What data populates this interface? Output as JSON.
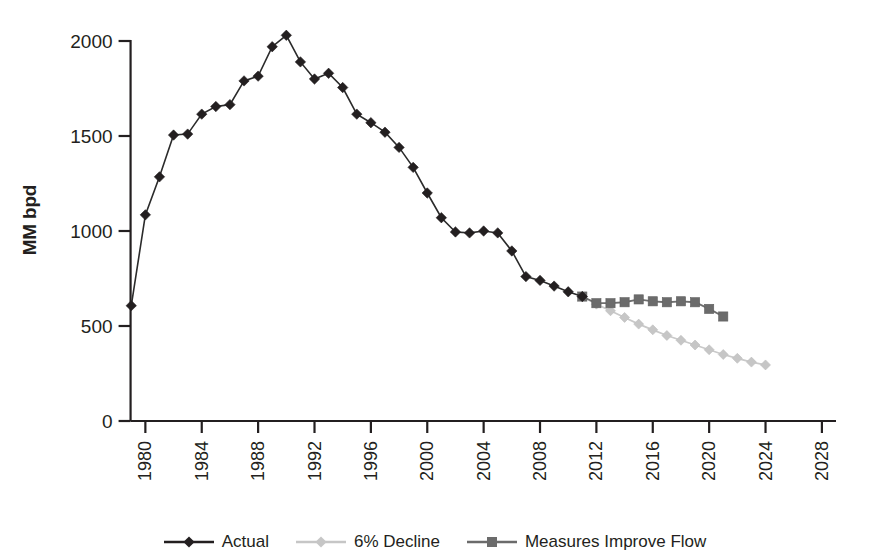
{
  "chart_data": {
    "type": "line",
    "title": "",
    "xlabel": "",
    "ylabel": "MM bpd",
    "xlim": [
      1978.2,
      2029.0
    ],
    "ylim": [
      0,
      2100
    ],
    "grid": false,
    "legend_position": "bottom-center",
    "y_ticks": [
      0,
      500,
      1000,
      1500,
      2000
    ],
    "y_tick_labels": [
      "0",
      "500",
      "1000",
      "1500",
      "2000"
    ],
    "x_ticks": [
      1980,
      1984,
      1988,
      1992,
      1996,
      2000,
      2004,
      2008,
      2012,
      2016,
      2020,
      2024,
      2028
    ],
    "x_tick_labels": [
      "1980",
      "1984",
      "1988",
      "1992",
      "1996",
      "2000",
      "2004",
      "2008",
      "2012",
      "2016",
      "2020",
      "2024",
      "2028"
    ],
    "x_tick_rotation": 90,
    "series": [
      {
        "name": "Actual",
        "color": "#231f20",
        "marker": "diamond",
        "x": [
          1979,
          1980,
          1981,
          1982,
          1983,
          1984,
          1985,
          1986,
          1987,
          1988,
          1989,
          1990,
          1991,
          1992,
          1993,
          1994,
          1995,
          1996,
          1997,
          1998,
          1999,
          2000,
          2001,
          2002,
          2003,
          2004,
          2005,
          2006,
          2007,
          2008,
          2009,
          2010,
          2011
        ],
        "y": [
          607,
          1085,
          1285,
          1505,
          1510,
          1615,
          1655,
          1665,
          1790,
          1815,
          1970,
          2030,
          1890,
          1800,
          1830,
          1755,
          1615,
          1570,
          1520,
          1440,
          1335,
          1200,
          1070,
          995,
          990,
          1000,
          990,
          895,
          760,
          740,
          710,
          680,
          655
        ]
      },
      {
        "name": "6% Decline",
        "color": "#c6c6c6",
        "marker": "diamond",
        "x": [
          2011,
          2012,
          2013,
          2014,
          2015,
          2016,
          2017,
          2018,
          2019,
          2020,
          2021,
          2022,
          2023,
          2024
        ],
        "y": [
          655,
          615,
          580,
          545,
          510,
          480,
          450,
          425,
          400,
          375,
          350,
          330,
          310,
          295
        ]
      },
      {
        "name": "Measures Improve Flow",
        "color": "#6b6b6b",
        "marker": "square",
        "x": [
          2011,
          2012,
          2013,
          2014,
          2015,
          2016,
          2017,
          2018,
          2019,
          2020,
          2021
        ],
        "y": [
          655,
          620,
          620,
          625,
          640,
          630,
          625,
          630,
          625,
          590,
          550
        ]
      }
    ]
  },
  "legend": {
    "items": [
      {
        "label": "Actual",
        "color": "#231f20",
        "marker": "diamond"
      },
      {
        "label": "6% Decline",
        "color": "#c6c6c6",
        "marker": "diamond"
      },
      {
        "label": "Measures Improve Flow",
        "color": "#6b6b6b",
        "marker": "square"
      }
    ]
  },
  "axes": {
    "y_title": "MM bpd"
  }
}
